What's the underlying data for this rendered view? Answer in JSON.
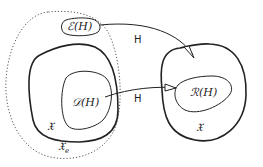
{
  "diagram": {
    "labels": {
      "extension": "ℰ(H)",
      "domain": "𝒟(H)",
      "range": "ℛ(H)",
      "space_left": "𝔛",
      "space_extended": "𝔛",
      "space_extended_sub": "e",
      "space_right": "𝔛",
      "arrow_top": "H",
      "arrow_bottom": "H"
    },
    "colors": {
      "stroke": "#222222",
      "dotted": "#555555",
      "background": "#ffffff"
    }
  }
}
